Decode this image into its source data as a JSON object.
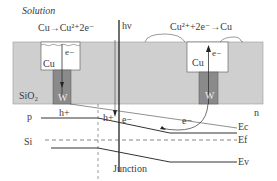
{
  "title": "Solution",
  "reactions": {
    "anode": "Cu→Cu²⁺2e⁻",
    "cathode": "Cu²⁺+2e⁻→Cu"
  },
  "light_label": "hν",
  "layers": {
    "oxide": "SiO₂",
    "left_metal": "Cu",
    "right_metal": "Cu",
    "left_plug": "W",
    "right_plug": "W"
  },
  "regions": {
    "p_side": "p",
    "n_side": "n",
    "substrate": "Si",
    "junction": "Junction"
  },
  "carriers": {
    "left_well_electron": "e−",
    "right_well_electron": "e−",
    "hole_left": "h+",
    "hole_junction": "h+",
    "electron_junction": "e−",
    "electron_right": "e−"
  },
  "band_labels": {
    "conduction": "Ec",
    "fermi": "Ef",
    "valence": "Ev"
  },
  "colors": {
    "oxide_fill": "#cfcfcf",
    "plug_fill": "#8a8a8a",
    "line": "#333333",
    "background": "#ffffff"
  }
}
